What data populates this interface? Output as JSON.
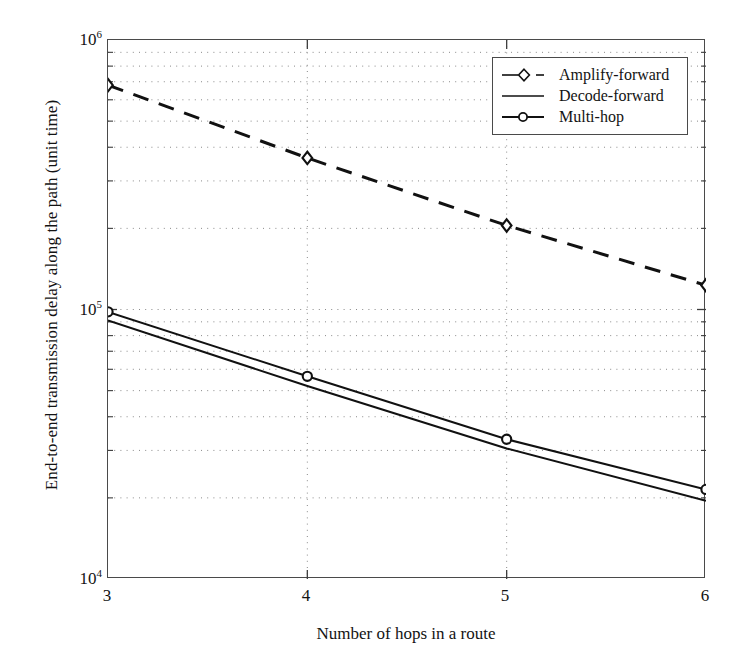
{
  "chart_data": {
    "type": "line",
    "title": "",
    "xlabel": "Number of hops in a route",
    "ylabel": "End-to-end transmission delay along the path (unit time)",
    "x": [
      3,
      4,
      5,
      6
    ],
    "xtick_labels": [
      "3",
      "4",
      "5",
      "6"
    ],
    "ytick_labels": [
      "10",
      "10",
      "10"
    ],
    "ytick_exponents": [
      "6",
      "5",
      "4"
    ],
    "ytick_values": [
      1000000,
      100000,
      10000
    ],
    "xlim": [
      3,
      6
    ],
    "ylim": [
      10000,
      1000000
    ],
    "yscale": "log",
    "xscale": "linear",
    "grid": "dotted-minor-and-major",
    "legend_position": "top-right",
    "series": [
      {
        "name": "Amplify-forward",
        "values": [
          680000,
          365000,
          205000,
          123000
        ],
        "linestyle": "dashed",
        "marker": "diamond",
        "color": "#111111"
      },
      {
        "name": "Decode-forward",
        "values": [
          91000,
          52000,
          30500,
          19500
        ],
        "linestyle": "solid",
        "marker": "none",
        "color": "#111111"
      },
      {
        "name": "Multi-hop",
        "values": [
          98000,
          56500,
          33000,
          21500
        ],
        "linestyle": "solid",
        "marker": "circle",
        "color": "#111111"
      }
    ]
  },
  "legend": {
    "items": [
      {
        "label": "Amplify-forward",
        "marker": "diamond-dashed-sample"
      },
      {
        "label": "Decode-forward",
        "marker": "solid-line-sample"
      },
      {
        "label": "Multi-hop",
        "marker": "circle-solid-sample"
      }
    ]
  },
  "axes": {
    "x_label": "Number of hops in a route",
    "y_label": "End-to-end transmission delay along the path (unit time)",
    "x_ticks": [
      "3",
      "4",
      "5",
      "6"
    ],
    "y_ticks": [
      {
        "mantissa": "10",
        "exponent": "6"
      },
      {
        "mantissa": "10",
        "exponent": "5"
      },
      {
        "mantissa": "10",
        "exponent": "4"
      }
    ]
  }
}
